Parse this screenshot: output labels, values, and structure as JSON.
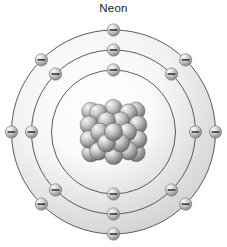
{
  "figure": {
    "title": "Neon",
    "type": "bohr-atomic-model",
    "element_name": "Neon",
    "width": 227,
    "height": 247,
    "background_color": "#ffffff"
  },
  "chart_data": {
    "type": "diagram",
    "title": "Neon",
    "subtitle": "",
    "xlabel": "",
    "ylabel": "",
    "diagram_kind": "bohr-atomic-model",
    "element": {
      "name": "Neon",
      "symbol": "Ne",
      "atomic_number": 10
    },
    "center": {
      "x": 113.5,
      "y": 132
    },
    "nucleus": {
      "label": "nucleus",
      "radius": 36,
      "nucleon_count": 20,
      "nucleon_radius": 9,
      "fill_light": "#f2f2f2",
      "fill_dark": "#6e6e6e",
      "stroke": "#5a5a5a"
    },
    "shells": [
      {
        "index": 1,
        "name": "K",
        "radius": 62,
        "electron_count": 2,
        "electron_angles": [
          -90,
          90
        ],
        "stroke": "#4a4a4a",
        "fill_start": "#ffffff",
        "fill_end": "#dcdcdc"
      },
      {
        "index": 2,
        "name": "L",
        "radius": 82,
        "electron_count": 8,
        "electron_angles": [
          -90,
          -45,
          0,
          45,
          90,
          135,
          180,
          225
        ],
        "stroke": "#4a4a4a",
        "fill_start": "#ffffff",
        "fill_end": "#d4d4d4"
      },
      {
        "index": 3,
        "name": "M",
        "radius": 102,
        "electron_count": 8,
        "electron_angles": [
          -90,
          -45,
          0,
          45,
          90,
          135,
          180,
          225
        ],
        "stroke": "#4a4a4a",
        "fill_start": "#ffffff",
        "fill_end": "#cccccc"
      }
    ],
    "electron": {
      "label": "electron",
      "glyph": "minus-sign",
      "radius": 6.2,
      "fill_light": "#f4f4f4",
      "fill_mid": "#c8c8c8",
      "fill_dark": "#8a8a8a",
      "stroke": "#777777",
      "sign_color": "#2b2b2b"
    },
    "legend": [],
    "annotations": [],
    "colors": {
      "background": "#ffffff",
      "shell_line": "#4a4a4a",
      "shell_fill": "#d8d8d8",
      "nucleon": "#8f8f8f",
      "text": "#1a1a1a"
    }
  }
}
